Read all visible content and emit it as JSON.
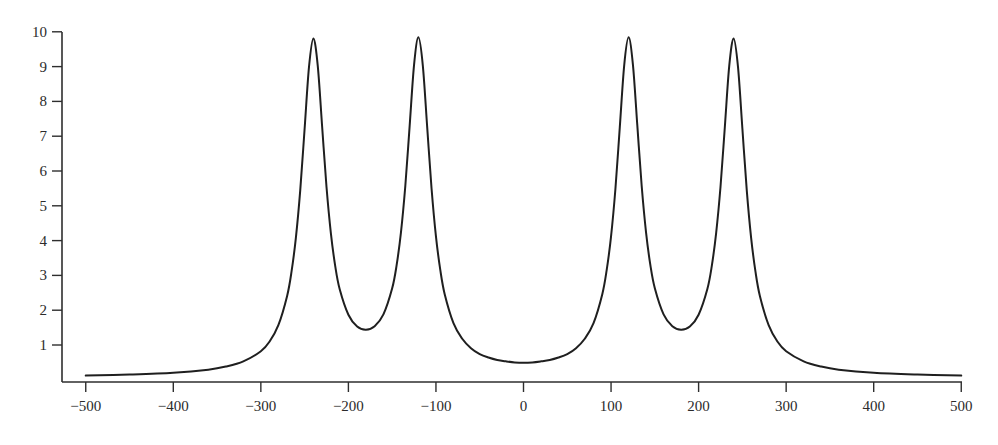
{
  "chart_data": {
    "type": "line",
    "title": "",
    "xlabel": "",
    "ylabel": "",
    "xlim": [
      -500,
      500
    ],
    "ylim": [
      0,
      10
    ],
    "grid": false,
    "legend": null,
    "x_ticks": [
      -500,
      -400,
      -300,
      -200,
      -100,
      0,
      100,
      200,
      300,
      400,
      500
    ],
    "x_tick_labels": [
      "−500",
      "−400",
      "−300",
      "−200",
      "−100",
      "0",
      "100",
      "200",
      "300",
      "400",
      "500"
    ],
    "y_ticks": [
      1,
      2,
      3,
      4,
      5,
      6,
      7,
      8,
      9,
      10
    ],
    "y_tick_labels": [
      "1",
      "2",
      "3",
      "4",
      "5",
      "6",
      "7",
      "8",
      "9",
      "10"
    ],
    "series": [
      {
        "name": "curve",
        "color": "#1f1f1f",
        "x": [
          -500,
          -450,
          -400,
          -360,
          -340,
          -320,
          -300,
          -290,
          -280,
          -270,
          -265,
          -260,
          -255,
          -250,
          -245,
          -240,
          -235,
          -230,
          -225,
          -220,
          -215,
          -210,
          -200,
          -190,
          -180,
          -170,
          -160,
          -150,
          -145,
          -140,
          -135,
          -130,
          -125,
          -120,
          -115,
          -110,
          -105,
          -100,
          -95,
          -90,
          -80,
          -70,
          -60,
          -50,
          -40,
          -30,
          -20,
          -10,
          0,
          10,
          20,
          30,
          40,
          50,
          60,
          70,
          80,
          90,
          95,
          100,
          105,
          110,
          115,
          120,
          125,
          130,
          135,
          140,
          145,
          150,
          160,
          170,
          180,
          190,
          200,
          210,
          215,
          220,
          225,
          230,
          235,
          240,
          245,
          250,
          255,
          260,
          265,
          270,
          280,
          290,
          300,
          320,
          340,
          360,
          400,
          450,
          500
        ],
        "y": [
          0.12,
          0.15,
          0.2,
          0.29,
          0.38,
          0.53,
          0.82,
          1.1,
          1.57,
          2.41,
          3.1,
          4.08,
          5.45,
          7.22,
          8.99,
          9.81,
          9.02,
          7.28,
          5.54,
          4.21,
          3.26,
          2.61,
          1.87,
          1.53,
          1.44,
          1.54,
          1.88,
          2.63,
          3.28,
          4.23,
          5.57,
          7.31,
          9.05,
          9.84,
          9.03,
          7.26,
          5.49,
          4.12,
          3.15,
          2.46,
          1.63,
          1.18,
          0.91,
          0.74,
          0.64,
          0.57,
          0.53,
          0.5,
          0.49,
          0.5,
          0.53,
          0.57,
          0.64,
          0.74,
          0.91,
          1.18,
          1.63,
          2.46,
          3.15,
          4.12,
          5.49,
          7.26,
          9.03,
          9.84,
          9.05,
          7.31,
          5.57,
          4.23,
          3.28,
          2.63,
          1.88,
          1.54,
          1.44,
          1.53,
          1.87,
          2.61,
          3.26,
          4.21,
          5.54,
          7.28,
          9.02,
          9.81,
          8.99,
          7.22,
          5.45,
          4.08,
          3.1,
          2.41,
          1.57,
          1.1,
          0.82,
          0.53,
          0.38,
          0.29,
          0.2,
          0.15,
          0.12
        ]
      }
    ],
    "annotations": []
  },
  "layout": {
    "plot_left": 62,
    "plot_right": 962,
    "plot_top": 32,
    "axis_y": 382,
    "x_zero_px": 523.5,
    "x_scale": 0.8755,
    "y_zero_px": 379.8,
    "y_scale": 34.8
  }
}
